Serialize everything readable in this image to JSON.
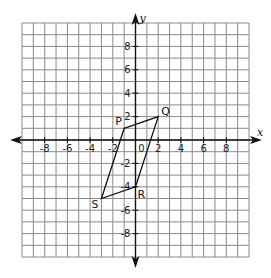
{
  "diagram": {
    "type": "coordinate-plane",
    "axes": {
      "x_label": "x",
      "y_label": "y",
      "x_range": [
        -10,
        10
      ],
      "y_range": [
        -10,
        10
      ],
      "grid_step": 1,
      "x_tick_labels": [
        "-8",
        "-6",
        "-4",
        "-2",
        "0",
        "2",
        "4",
        "6",
        "8"
      ],
      "x_tick_values": [
        -8,
        -6,
        -4,
        -2,
        0,
        2,
        4,
        6,
        8
      ],
      "y_tick_labels": [
        "8",
        "6",
        "4",
        "2",
        "-2",
        "-4",
        "-6",
        "-8"
      ],
      "y_tick_values": [
        8,
        6,
        4,
        2,
        -2,
        -4,
        -6,
        -8
      ]
    },
    "shape": {
      "kind": "parallelogram",
      "name": "PQRS",
      "vertices": [
        {
          "label": "P",
          "x": -1,
          "y": 1
        },
        {
          "label": "Q",
          "x": 2,
          "y": 2
        },
        {
          "label": "R",
          "x": 0,
          "y": -4
        },
        {
          "label": "S",
          "x": -3,
          "y": -5
        }
      ]
    },
    "colors": {
      "grid": "#8a8a8a",
      "axis": "#111111",
      "shape": "#111111",
      "background": "#ffffff"
    }
  }
}
